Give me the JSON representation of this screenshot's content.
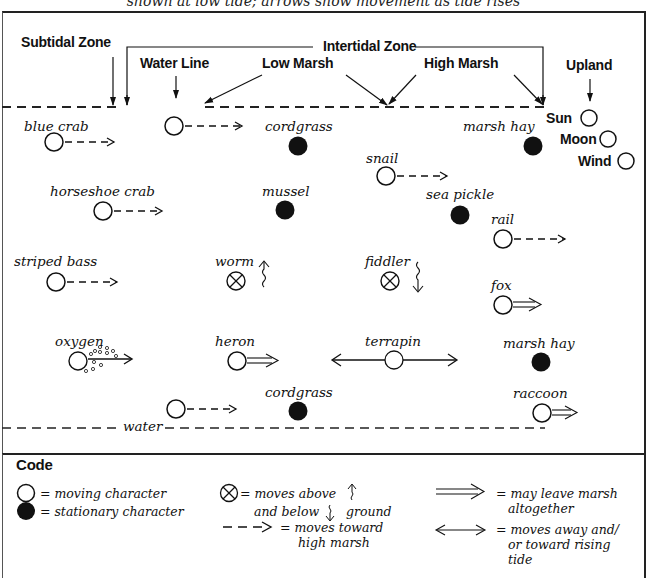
{
  "caption": "shown at low tide; arrows show movement as tide rises",
  "zones": {
    "subtidal": "Subtidal Zone",
    "water_line": "Water Line",
    "low_marsh": "Low Marsh",
    "intertidal": "Intertidal Zone",
    "high_marsh": "High Marsh",
    "upland": "Upland"
  },
  "upland_elements": [
    {
      "label": "Sun",
      "type": "moving"
    },
    {
      "label": "Moon",
      "type": "moving"
    },
    {
      "label": "Wind",
      "type": "moving"
    }
  ],
  "characters": [
    {
      "label": "blue crab",
      "type": "moving",
      "arrow": "dashed"
    },
    {
      "label": "",
      "type": "moving",
      "arrow": "dashed",
      "note": "unlabeled at water line"
    },
    {
      "label": "cordgrass",
      "type": "stationary"
    },
    {
      "label": "marsh hay",
      "type": "stationary"
    },
    {
      "label": "snail",
      "type": "moving",
      "arrow": "dashed"
    },
    {
      "label": "horseshoe crab",
      "type": "moving",
      "arrow": "dashed"
    },
    {
      "label": "mussel",
      "type": "stationary"
    },
    {
      "label": "sea pickle",
      "type": "stationary"
    },
    {
      "label": "rail",
      "type": "moving",
      "arrow": "dashed"
    },
    {
      "label": "striped bass",
      "type": "moving",
      "arrow": "dashed"
    },
    {
      "label": "worm",
      "type": "burrowing",
      "arrow": "up-squiggle"
    },
    {
      "label": "fiddler",
      "type": "burrowing",
      "arrow": "down-squiggle"
    },
    {
      "label": "fox",
      "type": "moving",
      "arrow": "double"
    },
    {
      "label": "oxygen",
      "type": "moving",
      "arrow": "bubbles"
    },
    {
      "label": "heron",
      "type": "moving",
      "arrow": "double"
    },
    {
      "label": "terrapin",
      "type": "moving",
      "arrow": "both-ways"
    },
    {
      "label": "marsh hay",
      "type": "stationary"
    },
    {
      "label": "",
      "type": "moving",
      "arrow": "dashed",
      "note": "unlabeled near water"
    },
    {
      "label": "cordgrass",
      "type": "stationary"
    },
    {
      "label": "raccoon",
      "type": "moving",
      "arrow": "double"
    }
  ],
  "water_label": "water",
  "code": {
    "title": "Code",
    "moving": "= moving character",
    "stationary": "= stationary character",
    "burrow_1": "= moves above",
    "burrow_2": "and below",
    "burrow_3": "ground",
    "dashed_1": "= moves toward",
    "dashed_2": "high marsh",
    "double_1": "= may leave marsh",
    "double_2": "altogether",
    "both_1": "= moves away and/",
    "both_2": "or toward rising",
    "both_3": "tide"
  }
}
